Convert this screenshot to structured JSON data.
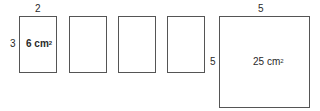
{
  "diagram": {
    "small_rect": {
      "width_label": "2",
      "height_label": "3",
      "area_value": "6 cm",
      "area_exp": "2"
    },
    "blank_rect_count": 3,
    "square": {
      "width_label": "5",
      "height_label": "5",
      "area_value": "25 cm",
      "area_exp": "2"
    }
  }
}
